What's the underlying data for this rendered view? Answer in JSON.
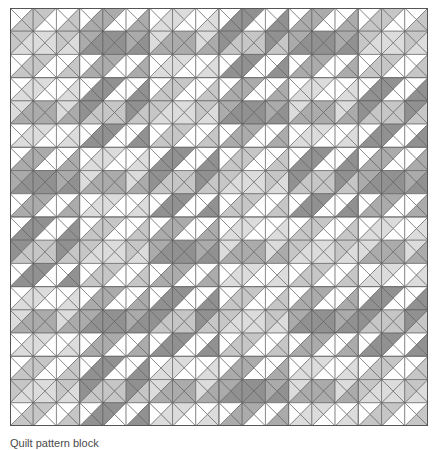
{
  "figure": {
    "name": "quilt-pattern",
    "caption": "Quilt pattern block",
    "title": "Quilt pattern"
  },
  "canvas": {
    "width": 438,
    "height": 450,
    "background": "#ffffff"
  },
  "quilt": {
    "origin_x": 10,
    "origin_y": 8,
    "size": 418,
    "cols": 18,
    "rows": 18,
    "cell": 23.2222,
    "block_cells": 3,
    "blocks_across": 6,
    "blocks_down": 6,
    "grid_line_color": "#6e6e6e",
    "grid_line_width": 0.8,
    "triangle_edge_color": "#555555",
    "triangle_edge_width": 0.55,
    "border_color": "#555555",
    "border_width": 1.0
  },
  "palette": {
    "white": "#ffffff",
    "light": "#dcdcdc",
    "mid_light": "#c6c6c6",
    "mid": "#ababab",
    "dark": "#919191",
    "darker": "#7d7d7d"
  },
  "shade_keys": [
    "white",
    "light",
    "mid_light",
    "mid",
    "dark",
    "darker"
  ],
  "block_variants": {
    "description": "Each 3x3-cell block is a concentric-diamond motif. Values index shade_keys for the four triangles (top,right,bottom,left) of each of the 9 cells, listed row-major.",
    "A": [
      [
        0,
        1,
        1,
        0
      ],
      [
        1,
        0,
        0,
        1
      ],
      [
        0,
        1,
        1,
        0
      ],
      [
        1,
        3,
        3,
        1
      ],
      [
        3,
        3,
        3,
        3
      ],
      [
        1,
        3,
        3,
        1
      ],
      [
        0,
        1,
        1,
        0
      ],
      [
        1,
        0,
        0,
        1
      ],
      [
        0,
        1,
        1,
        0
      ]
    ],
    "B": [
      [
        0,
        3,
        3,
        0
      ],
      [
        3,
        0,
        0,
        3
      ],
      [
        0,
        3,
        3,
        0
      ],
      [
        3,
        4,
        4,
        3
      ],
      [
        4,
        4,
        4,
        4
      ],
      [
        3,
        4,
        4,
        3
      ],
      [
        0,
        3,
        3,
        0
      ],
      [
        3,
        0,
        0,
        3
      ],
      [
        0,
        3,
        3,
        0
      ]
    ],
    "C": [
      [
        0,
        2,
        2,
        0
      ],
      [
        2,
        0,
        0,
        2
      ],
      [
        0,
        2,
        2,
        0
      ],
      [
        2,
        1,
        1,
        2
      ],
      [
        1,
        1,
        1,
        1
      ],
      [
        2,
        1,
        1,
        2
      ],
      [
        0,
        2,
        2,
        0
      ],
      [
        2,
        0,
        0,
        2
      ],
      [
        0,
        2,
        2,
        0
      ]
    ],
    "D": [
      [
        0,
        4,
        4,
        0
      ],
      [
        4,
        0,
        0,
        4
      ],
      [
        0,
        4,
        4,
        0
      ],
      [
        4,
        2,
        2,
        4
      ],
      [
        2,
        2,
        2,
        2
      ],
      [
        4,
        2,
        2,
        4
      ],
      [
        0,
        4,
        4,
        0
      ],
      [
        4,
        0,
        0,
        4
      ],
      [
        0,
        4,
        4,
        0
      ]
    ]
  },
  "block_layout": [
    [
      "C",
      "B",
      "A",
      "D",
      "B",
      "C"
    ],
    [
      "A",
      "D",
      "C",
      "B",
      "A",
      "D"
    ],
    [
      "B",
      "A",
      "D",
      "C",
      "D",
      "B"
    ],
    [
      "D",
      "C",
      "B",
      "A",
      "C",
      "A"
    ],
    [
      "A",
      "B",
      "D",
      "C",
      "B",
      "D"
    ],
    [
      "C",
      "D",
      "A",
      "B",
      "A",
      "C"
    ]
  ],
  "cell_shades_note": "Rendered triangles are derived from block_layout + block_variants by the template script.",
  "axes": {
    "visible": false
  }
}
